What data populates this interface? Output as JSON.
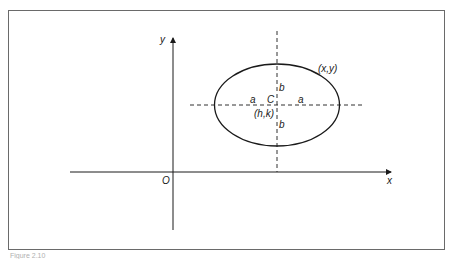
{
  "figure": {
    "caption": "Figure 2.10",
    "colors": {
      "line": "#1a1a1a",
      "frame": "#6a6a6a",
      "background": "#ffffff"
    }
  },
  "axes": {
    "x_label": "x",
    "y_label": "y",
    "origin_label": "O"
  },
  "ellipse": {
    "center_label": "C",
    "center_coords": "(h,k)",
    "point_label": "(x,y)",
    "semi_major_left": "a",
    "semi_major_right": "a",
    "semi_minor_top": "b",
    "semi_minor_bottom": "b"
  }
}
